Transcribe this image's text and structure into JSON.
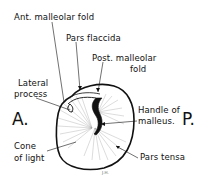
{
  "diagram": {
    "labels": {
      "ant_malleolar_fold": "Ant. malleolar fold",
      "pars_flaccida": "Pars flaccida",
      "post_malleolar_fold_l1": "Post. malleolar",
      "post_malleolar_fold_l2": "fold",
      "lateral_process_l1": "Lateral",
      "lateral_process_l2": "process",
      "handle_malleus_l1": "Handle of",
      "handle_malleus_l2": "malleus.",
      "cone_of_light_l1": "Cone",
      "cone_of_light_l2": "of light",
      "pars_tensa": "Pars tensa"
    },
    "orientation": {
      "anterior": "A.",
      "posterior": "P."
    },
    "signature": "J.H.",
    "colors": {
      "ink": "#111111",
      "background": "#ffffff",
      "stipple": "#9a9a9a"
    }
  }
}
